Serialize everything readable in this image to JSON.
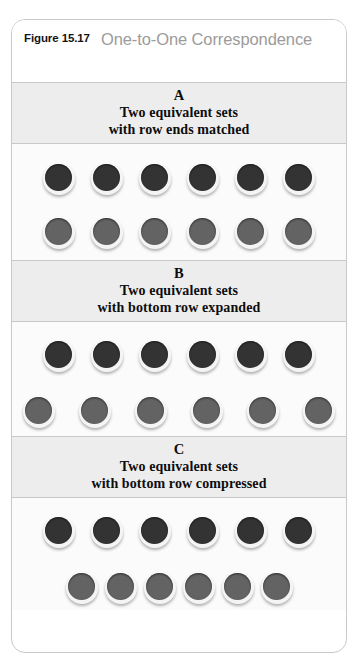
{
  "figure": {
    "number": "Figure 15.17",
    "title": "One-to-One Correspondence",
    "title_color": "#9b9b9b",
    "border_color": "#c9c9c9",
    "band_color": "#ededed"
  },
  "tokens": {
    "dark_color": "#333333",
    "gray_color": "#636363",
    "rim_color": "#f4f4f4"
  },
  "sections": [
    {
      "letter": "A",
      "caption_line1": "Two equivalent sets",
      "caption_line2": "with row ends matched",
      "top_row": {
        "count": 6,
        "color": "dark",
        "spacing": "normal"
      },
      "bottom_row": {
        "count": 6,
        "color": "gray",
        "spacing": "normal"
      }
    },
    {
      "letter": "B",
      "caption_line1": "Two equivalent sets",
      "caption_line2": "with bottom row expanded",
      "top_row": {
        "count": 6,
        "color": "dark",
        "spacing": "normal"
      },
      "bottom_row": {
        "count": 6,
        "color": "gray",
        "spacing": "expanded"
      }
    },
    {
      "letter": "C",
      "caption_line1": "Two equivalent sets",
      "caption_line2": "with bottom row compressed",
      "top_row": {
        "count": 6,
        "color": "dark",
        "spacing": "normal"
      },
      "bottom_row": {
        "count": 6,
        "color": "gray",
        "spacing": "compressed"
      }
    }
  ]
}
